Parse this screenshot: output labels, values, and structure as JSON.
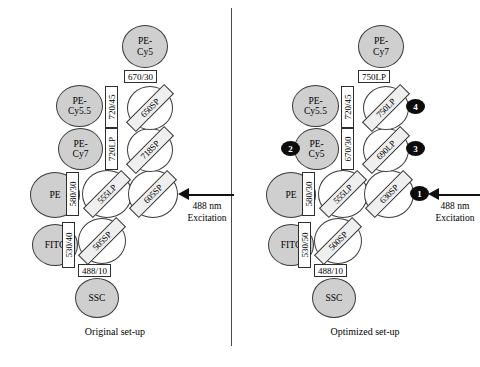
{
  "figure": {
    "excitation": {
      "line1": "488 nm",
      "line2": "Excitation"
    }
  },
  "panels": [
    {
      "id": "original",
      "caption": "Original set-up",
      "detectors": [
        {
          "name": "ssc",
          "line1": "SSC",
          "line2": ""
        },
        {
          "name": "fitc",
          "line1": "FITC",
          "line2": ""
        },
        {
          "name": "pe",
          "line1": "PE",
          "line2": ""
        },
        {
          "name": "pecy7",
          "line1": "PE-",
          "line2": "Cy7"
        },
        {
          "name": "pecy55",
          "line1": "PE-",
          "line2": "Cy5.5"
        },
        {
          "name": "pecy5",
          "line1": "PE-",
          "line2": "Cy5"
        }
      ],
      "bandpass": [
        {
          "name": "ssc-filter",
          "label": "488/10"
        },
        {
          "name": "fitc-filter",
          "label": "530/40"
        },
        {
          "name": "pe-filter",
          "label": "580/30"
        },
        {
          "name": "pecy7-filter",
          "label": "720LP"
        },
        {
          "name": "pecy55-filter",
          "label": "720/45"
        },
        {
          "name": "pecy5-filter",
          "label": "670/30"
        }
      ],
      "mirrors": [
        {
          "name": "mirror-505sp",
          "label": "505SP"
        },
        {
          "name": "mirror-555lp",
          "label": "555LP"
        },
        {
          "name": "mirror-605sp",
          "label": "605SP"
        },
        {
          "name": "mirror-718sp",
          "label": "718SP"
        },
        {
          "name": "mirror-650sp",
          "label": "650SP"
        }
      ],
      "badges": []
    },
    {
      "id": "optimized",
      "caption": "Optimized set-up",
      "detectors": [
        {
          "name": "ssc",
          "line1": "SSC",
          "line2": ""
        },
        {
          "name": "fitc",
          "line1": "FITC",
          "line2": ""
        },
        {
          "name": "pe",
          "line1": "PE",
          "line2": ""
        },
        {
          "name": "pecy5",
          "line1": "PE-",
          "line2": "Cy5"
        },
        {
          "name": "pecy55",
          "line1": "PE-",
          "line2": "Cy5.5"
        },
        {
          "name": "pecy7",
          "line1": "PE-",
          "line2": "Cy7"
        }
      ],
      "bandpass": [
        {
          "name": "ssc-filter",
          "label": "488/10"
        },
        {
          "name": "fitc-filter",
          "label": "530/50"
        },
        {
          "name": "pe-filter",
          "label": "580/30"
        },
        {
          "name": "pecy5-filter",
          "label": "670/30"
        },
        {
          "name": "pecy55-filter",
          "label": "720/45"
        },
        {
          "name": "pecy7-filter",
          "label": "750LP"
        }
      ],
      "mirrors": [
        {
          "name": "mirror-500sp",
          "label": "500SP"
        },
        {
          "name": "mirror-555lp",
          "label": "555LP"
        },
        {
          "name": "mirror-630sp",
          "label": "630SP"
        },
        {
          "name": "mirror-690lp",
          "label": "690LP"
        },
        {
          "name": "mirror-750lp",
          "label": "750LP"
        }
      ],
      "badges": [
        {
          "name": "badge-1",
          "label": "1"
        },
        {
          "name": "badge-2",
          "label": "2"
        },
        {
          "name": "badge-3",
          "label": "3"
        },
        {
          "name": "badge-4",
          "label": "4"
        }
      ]
    }
  ]
}
